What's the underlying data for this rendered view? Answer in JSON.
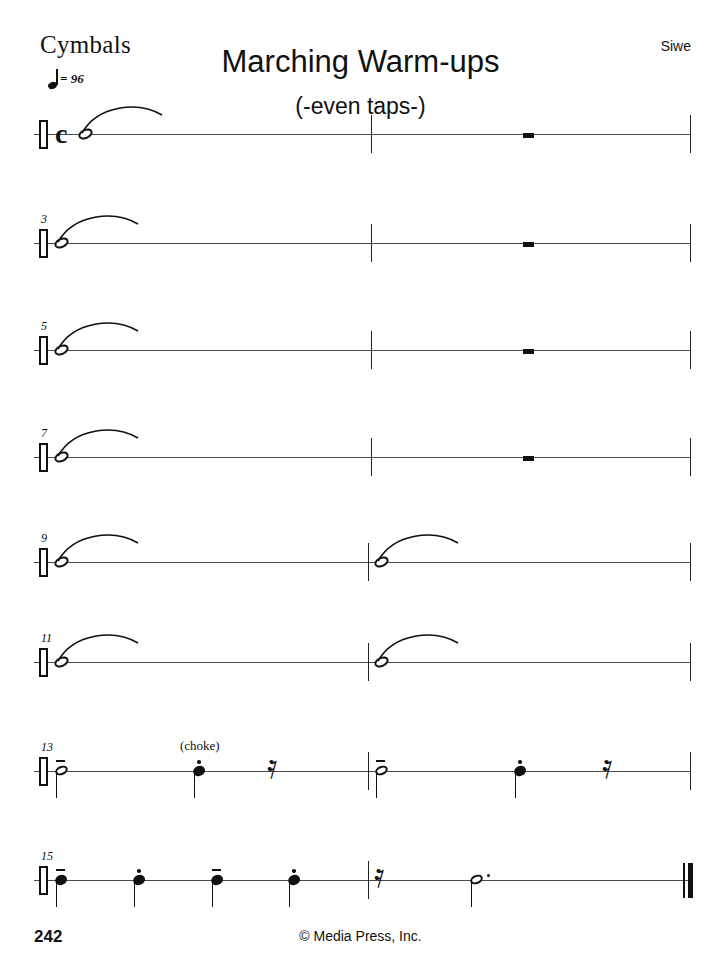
{
  "page": {
    "instrument": "Cymbals",
    "title": "Marching Warm-ups",
    "subtitle": "(-even taps-)",
    "composer": "Siwe",
    "page_number": "242",
    "copyright": "© Media Press, Inc.",
    "tempo": {
      "beat_unit": "quarter-note",
      "equals": "= 96"
    },
    "clef": "percussion-clef",
    "time_signature": "c",
    "time_signature_name": "common-time"
  },
  "systems": [
    {
      "measure_number": "",
      "measures": [
        {
          "number": "1",
          "elements": [
            {
              "type": "whole-note",
              "slur": true
            },
            {
              "type": "slur"
            }
          ]
        },
        {
          "number": "2",
          "elements": [
            {
              "type": "whole-rest"
            }
          ]
        }
      ]
    },
    {
      "measure_number": "3",
      "measures": [
        {
          "number": "3",
          "elements": [
            {
              "type": "whole-note",
              "slur": true
            },
            {
              "type": "slur"
            }
          ]
        },
        {
          "number": "4",
          "elements": [
            {
              "type": "whole-rest"
            }
          ]
        }
      ]
    },
    {
      "measure_number": "5",
      "measures": [
        {
          "number": "5",
          "elements": [
            {
              "type": "whole-note",
              "slur": true
            },
            {
              "type": "slur"
            }
          ]
        },
        {
          "number": "6",
          "elements": [
            {
              "type": "whole-rest"
            }
          ]
        }
      ]
    },
    {
      "measure_number": "7",
      "measures": [
        {
          "number": "7",
          "elements": [
            {
              "type": "whole-note",
              "slur": true
            },
            {
              "type": "slur"
            }
          ]
        },
        {
          "number": "8",
          "elements": [
            {
              "type": "whole-rest"
            }
          ]
        }
      ]
    },
    {
      "measure_number": "9",
      "measures": [
        {
          "number": "9",
          "elements": [
            {
              "type": "whole-note",
              "slur": true
            },
            {
              "type": "slur"
            }
          ]
        },
        {
          "number": "10",
          "elements": [
            {
              "type": "whole-note",
              "slur": true
            },
            {
              "type": "slur"
            }
          ]
        }
      ]
    },
    {
      "measure_number": "11",
      "measures": [
        {
          "number": "11",
          "elements": [
            {
              "type": "whole-note",
              "slur": true
            },
            {
              "type": "slur"
            }
          ]
        },
        {
          "number": "12",
          "elements": [
            {
              "type": "whole-note",
              "slur": true
            },
            {
              "type": "slur"
            }
          ]
        }
      ]
    },
    {
      "measure_number": "13",
      "measures": [
        {
          "number": "13",
          "elements": [
            {
              "type": "half-note",
              "articulation": "tenuto"
            },
            {
              "type": "quarter-note",
              "articulation": "staccato",
              "text": "(choke)"
            },
            {
              "type": "quarter-rest"
            }
          ]
        },
        {
          "number": "14",
          "elements": [
            {
              "type": "half-note",
              "articulation": "tenuto"
            },
            {
              "type": "quarter-note",
              "articulation": "staccato"
            },
            {
              "type": "quarter-rest"
            }
          ]
        }
      ]
    },
    {
      "measure_number": "15",
      "measures": [
        {
          "number": "15",
          "elements": [
            {
              "type": "quarter-note",
              "articulation": "tenuto"
            },
            {
              "type": "quarter-note",
              "articulation": "staccato"
            },
            {
              "type": "quarter-note",
              "articulation": "tenuto"
            },
            {
              "type": "quarter-note",
              "articulation": "staccato"
            }
          ]
        },
        {
          "number": "16",
          "elements": [
            {
              "type": "quarter-rest"
            },
            {
              "type": "dotted-half-note"
            }
          ]
        }
      ]
    }
  ],
  "annotations": {
    "choke": "(choke)"
  },
  "measure_numbers": {
    "s1": "",
    "s2": "3",
    "s3": "5",
    "s4": "7",
    "s5": "9",
    "s6": "11",
    "s7": "13",
    "s8": "15"
  }
}
